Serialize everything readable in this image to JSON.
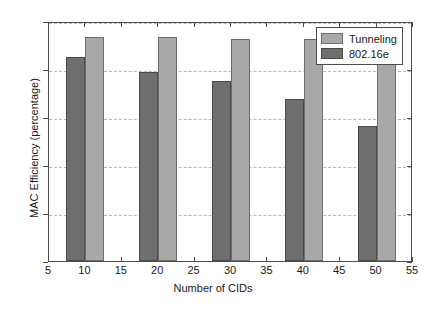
{
  "chart_data": {
    "type": "bar",
    "title": "",
    "xlabel": "Number of CIDs",
    "ylabel": "MAC Efficiency (percentage)",
    "categories": [
      10,
      20,
      30,
      40,
      50
    ],
    "series": [
      {
        "name": "802.16e",
        "color": "#6e6e6e",
        "values": [
          92.6,
          89.4,
          87.4,
          83.8,
          78.1
        ]
      },
      {
        "name": "Tunneling",
        "color": "#a8a8a8",
        "values": [
          96.6,
          96.6,
          96.2,
          96.2,
          96.2
        ]
      }
    ],
    "legend_order": [
      "Tunneling",
      "802.16e"
    ],
    "legend_position": "top-right",
    "xlim": [
      5,
      55
    ],
    "ylim": [
      50,
      100
    ],
    "xticks": [
      5,
      10,
      15,
      20,
      25,
      30,
      35,
      40,
      45,
      50,
      55
    ],
    "yticks": [
      50,
      60,
      70,
      80,
      90,
      100
    ],
    "xticklabels": [
      "5",
      "10",
      "15",
      "20",
      "25",
      "30",
      "35",
      "40",
      "45",
      "50",
      "55"
    ],
    "yticklabels": [
      "50",
      "60",
      "70",
      "80",
      "90",
      "100"
    ],
    "grid": "horizontal-dashed",
    "bar_width_units": 2.6
  }
}
